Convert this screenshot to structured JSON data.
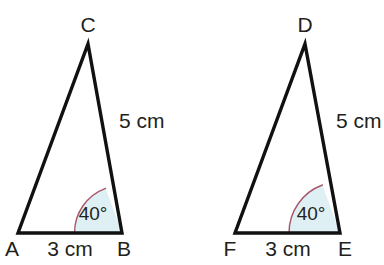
{
  "figure": {
    "background_color": "#ffffff",
    "stroke_color": "#111111",
    "text_color": "#231f20",
    "arc_stroke_color": "#a8566a",
    "arc_fill_color": "#dff0f5"
  },
  "triangles": [
    {
      "name": "triangle-abc",
      "apex_label": "C",
      "left_label": "A",
      "right_label": "B",
      "base_length_label": "3 cm",
      "side_length_label": "5 cm",
      "angle_label": "40°"
    },
    {
      "name": "triangle-def",
      "apex_label": "D",
      "left_label": "F",
      "right_label": "E",
      "base_length_label": "3 cm",
      "side_length_label": "5 cm",
      "angle_label": "40°"
    }
  ]
}
